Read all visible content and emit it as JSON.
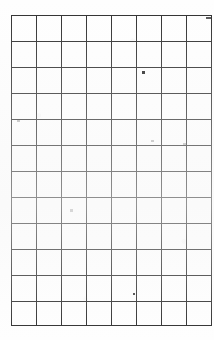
{
  "document": {
    "kind": "scanned-ruled-grid",
    "title": "Blank ruled grid sheet",
    "background_color": "#fefefe",
    "rule_color": "#2e2e2e"
  },
  "grid": {
    "columns": 8,
    "rows": 12,
    "origin_x": 11,
    "origin_y": 15,
    "right_edge": 203,
    "bottom_edge": 325,
    "column_width": 24,
    "row_height": 26,
    "last_row_height": 24,
    "column_x": [
      11,
      35,
      59,
      83,
      107,
      131,
      155,
      179,
      203
    ],
    "row_y": [
      15,
      41,
      67,
      93,
      119,
      145,
      171,
      197,
      223,
      249,
      275,
      301,
      325
    ],
    "cells": [
      [
        "",
        "",
        "",
        "",
        "",
        "",
        "",
        ""
      ],
      [
        "",
        "",
        "",
        "",
        "",
        "",
        "",
        ""
      ],
      [
        "",
        "",
        "",
        "",
        "",
        "",
        "",
        ""
      ],
      [
        "",
        "",
        "",
        "",
        "",
        "",
        "",
        ""
      ],
      [
        "",
        "",
        "",
        "",
        "",
        "",
        "",
        ""
      ],
      [
        "",
        "",
        "",
        "",
        "",
        "",
        "",
        ""
      ],
      [
        "",
        "",
        "",
        "",
        "",
        "",
        "",
        ""
      ],
      [
        "",
        "",
        "",
        "",
        "",
        "",
        "",
        ""
      ],
      [
        "",
        "",
        "",
        "",
        "",
        "",
        "",
        ""
      ],
      [
        "",
        "",
        "",
        "",
        "",
        "",
        "",
        ""
      ],
      [
        "",
        "",
        "",
        "",
        "",
        "",
        "",
        ""
      ],
      [
        "",
        "",
        "",
        "",
        "",
        "",
        "",
        ""
      ]
    ]
  },
  "artifacts": {
    "specks": [
      {
        "name": "ink-speck-upper-right",
        "x": 142,
        "y": 71,
        "w": 3,
        "h": 3,
        "color": "#242424"
      },
      {
        "name": "ink-speck-lower-mid",
        "x": 133,
        "y": 293,
        "w": 2,
        "h": 2,
        "color": "#3a3a3a"
      }
    ],
    "faint_marks": [
      {
        "name": "faint-mark-left-upper",
        "x": 17,
        "y": 120,
        "w": 3,
        "h": 2
      },
      {
        "name": "faint-mark-center",
        "x": 70,
        "y": 209,
        "w": 3,
        "h": 3
      },
      {
        "name": "faint-mark-right-upper",
        "x": 151,
        "y": 140,
        "w": 3,
        "h": 2
      },
      {
        "name": "faint-mark-right-edge",
        "x": 183,
        "y": 143,
        "w": 3,
        "h": 2
      }
    ],
    "edge_dash": {
      "name": "edge-dash-mark",
      "x": 206,
      "y": 17,
      "w": 5,
      "h": 2,
      "color": "#555555"
    }
  }
}
